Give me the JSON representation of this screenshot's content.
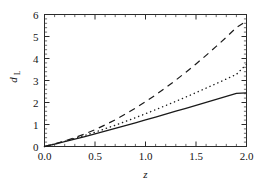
{
  "chart_data": {
    "type": "line",
    "title": "",
    "xlabel": "z",
    "ylabel": "d_L",
    "ylabel_main": "d",
    "ylabel_sub": "L",
    "xlim": [
      0.0,
      2.0
    ],
    "ylim": [
      0.0,
      6.0
    ],
    "grid": false,
    "legend": "none",
    "frame": true,
    "ticks_all_sides": true,
    "xticks": [
      0.0,
      0.5,
      1.0,
      1.5,
      2.0
    ],
    "xtick_labels": [
      "0.0",
      "0.5",
      "1.0",
      "1.5",
      "2.0"
    ],
    "xminor_step": 0.1,
    "yticks": [
      0,
      1,
      2,
      3,
      4,
      5,
      6
    ],
    "ytick_labels": [
      "0",
      "1",
      "2",
      "3",
      "4",
      "5",
      "6"
    ],
    "yminor_step": 0.2,
    "x": [
      0.0,
      0.1,
      0.2,
      0.3,
      0.4,
      0.5,
      0.6,
      0.7,
      0.8,
      0.9,
      1.0,
      1.1,
      1.2,
      1.3,
      1.4,
      1.5,
      1.6,
      1.7,
      1.8,
      1.9,
      2.0
    ],
    "series": [
      {
        "name": "solid",
        "style": "solid",
        "color": "#1a1a1a",
        "values": [
          0.0,
          0.107,
          0.219,
          0.334,
          0.452,
          0.573,
          0.696,
          0.821,
          0.948,
          1.077,
          1.207,
          1.338,
          1.47,
          1.603,
          1.737,
          1.872,
          2.007,
          2.143,
          2.28,
          2.417,
          2.44
        ]
      },
      {
        "name": "dotted",
        "style": "dotted",
        "color": "#1a1a1a",
        "values": [
          0.0,
          0.11,
          0.232,
          0.363,
          0.503,
          0.651,
          0.806,
          0.968,
          1.136,
          1.31,
          1.489,
          1.673,
          1.861,
          2.053,
          2.249,
          2.449,
          2.652,
          2.858,
          3.067,
          3.279,
          3.74
        ]
      },
      {
        "name": "dashed",
        "style": "dashed",
        "color": "#1a1a1a",
        "values": [
          0.0,
          0.115,
          0.25,
          0.4,
          0.572,
          0.765,
          0.98,
          1.215,
          1.47,
          1.744,
          2.036,
          2.346,
          2.673,
          3.017,
          3.377,
          3.752,
          4.143,
          4.549,
          4.969,
          5.404,
          5.7
        ]
      }
    ]
  },
  "axis": {
    "x_title": "z",
    "y_title_main": "d",
    "y_title_sub": "L"
  }
}
